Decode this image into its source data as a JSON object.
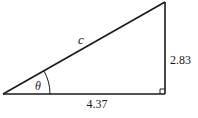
{
  "diagram": {
    "type": "right-triangle",
    "labels": {
      "hypotenuse": "c",
      "angle": "θ",
      "base": "4.37",
      "height": "2.83"
    },
    "right_angle_marker": true,
    "colors": {
      "stroke": "#1a1a1a",
      "background": "#ffffff"
    }
  }
}
